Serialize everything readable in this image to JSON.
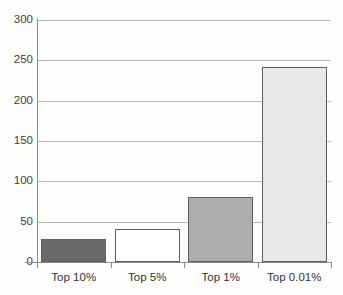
{
  "chart_data": {
    "type": "bar",
    "title": "",
    "subtitle": "",
    "xlabel": "",
    "ylabel": "",
    "categories": [
      "Top 10%",
      "Top 5%",
      "Top 1%",
      "Top 0.01%"
    ],
    "values": [
      28,
      41,
      80,
      242
    ],
    "ylim": [
      0,
      300
    ],
    "ytick_values": [
      0,
      50,
      100,
      150,
      200,
      250,
      300
    ],
    "ytick_labels": [
      "0",
      "50",
      "100",
      "150",
      "200",
      "250",
      "300"
    ],
    "grid": true,
    "grid_axis": "y",
    "legend": false,
    "legend_position": "none",
    "bar_colors": [
      "#6a6a6a",
      "#ffffff",
      "#adadad",
      "#e8e8e8"
    ],
    "bar_edge_color": "#5e5e5e",
    "axis_color": "#8a8a8a",
    "gridline_color": "#b9b9b9",
    "background_color": "#fdfdfc",
    "text_color": "#333333"
  }
}
